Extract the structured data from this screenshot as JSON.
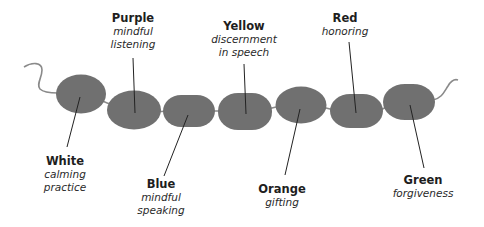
{
  "diagram": {
    "bead_color": "#707070",
    "string_color": "#8a8a8a",
    "leader_color": "#222222",
    "beads": [
      {
        "color_name": "White",
        "meaning": "calming practice",
        "meaning_lines": [
          "calming",
          "practice"
        ],
        "label_position": "below"
      },
      {
        "color_name": "Purple",
        "meaning": "mindful listening",
        "meaning_lines": [
          "mindful",
          "listening"
        ],
        "label_position": "above"
      },
      {
        "color_name": "Blue",
        "meaning": "mindful speaking",
        "meaning_lines": [
          "mindful",
          "speaking"
        ],
        "label_position": "below"
      },
      {
        "color_name": "Yellow",
        "meaning": "discernment in speech",
        "meaning_lines": [
          "discernment",
          "in speech"
        ],
        "label_position": "above"
      },
      {
        "color_name": "Orange",
        "meaning": "gifting",
        "meaning_lines": [
          "gifting"
        ],
        "label_position": "below"
      },
      {
        "color_name": "Red",
        "meaning": "honoring",
        "meaning_lines": [
          "honoring"
        ],
        "label_position": "above"
      },
      {
        "color_name": "Green",
        "meaning": "forgiveness",
        "meaning_lines": [
          "forgiveness"
        ],
        "label_position": "below"
      }
    ]
  }
}
